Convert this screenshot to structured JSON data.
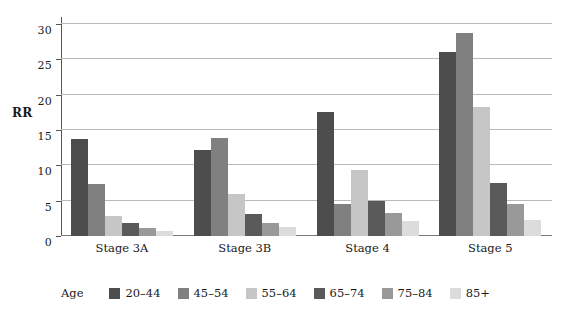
{
  "chart_data": {
    "type": "bar",
    "title": "",
    "xlabel": "",
    "ylabel": "RR",
    "legend_title": "Age",
    "legend_position": "bottom",
    "grid": true,
    "ylim": [
      0,
      30
    ],
    "yticks": [
      0,
      5,
      10,
      15,
      20,
      25,
      30
    ],
    "ytick_labels": [
      "0",
      "5",
      "10",
      "15",
      "20",
      "25",
      "30"
    ],
    "categories": [
      "Stage 3A",
      "Stage 3B",
      "Stage 4",
      "Stage 5"
    ],
    "series": [
      {
        "name": "20–44",
        "color": "#4d4d4d",
        "values": [
          13.7,
          12.2,
          17.5,
          26.1
        ]
      },
      {
        "name": "45–54",
        "color": "#808080",
        "values": [
          7.4,
          13.8,
          4.6,
          28.7
        ]
      },
      {
        "name": "55–64",
        "color": "#c6c6c6",
        "values": [
          2.9,
          5.9,
          9.3,
          18.3
        ]
      },
      {
        "name": "65–74",
        "color": "#5a5a5a",
        "values": [
          1.9,
          3.1,
          5.0,
          7.5
        ]
      },
      {
        "name": "75–84",
        "color": "#999999",
        "values": [
          1.2,
          1.8,
          3.3,
          4.5
        ]
      },
      {
        "name": "85+",
        "color": "#dcdcdc",
        "values": [
          0.7,
          1.3,
          2.1,
          2.3
        ]
      }
    ]
  },
  "colors": {
    "gridline": "#b9b9b9",
    "axis": "#555555",
    "text": "#1a1a1a",
    "background": "#ffffff"
  }
}
